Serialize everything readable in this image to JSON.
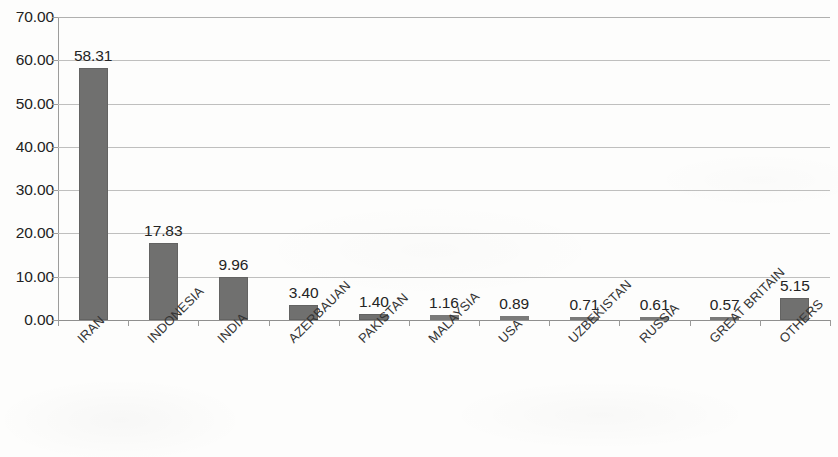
{
  "chart_data": {
    "type": "bar",
    "title": "",
    "subtitle": "",
    "xlabel": "",
    "ylabel": "",
    "categories": [
      "IRAN",
      "INDONESIA",
      "INDIA",
      "AZERBAUAN",
      "PAKISTAN",
      "MALAYSIA",
      "USA",
      "UZBEKISTAN",
      "RUSSIA",
      "GREAT BRITAIN",
      "OTHERS"
    ],
    "values": [
      58.31,
      17.83,
      9.96,
      3.4,
      1.4,
      1.16,
      0.89,
      0.71,
      0.61,
      0.57,
      5.15
    ],
    "data_labels": [
      "58.31",
      "17.83",
      "9.96",
      "3.40",
      "1.40",
      "1.16",
      "0.89",
      "0.71",
      "0.61",
      "0.57",
      "5.15"
    ],
    "ylim": [
      0,
      70
    ],
    "ytick_values": [
      0,
      10,
      20,
      30,
      40,
      50,
      60,
      70
    ],
    "ytick_labels": [
      "0.00",
      "10.00",
      "20.00",
      "30.00",
      "40.00",
      "50.00",
      "60.00",
      "70.00"
    ],
    "grid": true,
    "grid_axis": "y",
    "legend": false,
    "legend_position": "none",
    "bar_color": "#70706f",
    "grid_color": "#bfbfbe",
    "axis_color": "#9c9c9b",
    "background_color": "#fdfdfc",
    "text_color": "#242424",
    "series": [
      {
        "name": "share",
        "values": [
          58.31,
          17.83,
          9.96,
          3.4,
          1.4,
          1.16,
          0.89,
          0.71,
          0.61,
          0.57,
          5.15
        ]
      }
    ]
  }
}
